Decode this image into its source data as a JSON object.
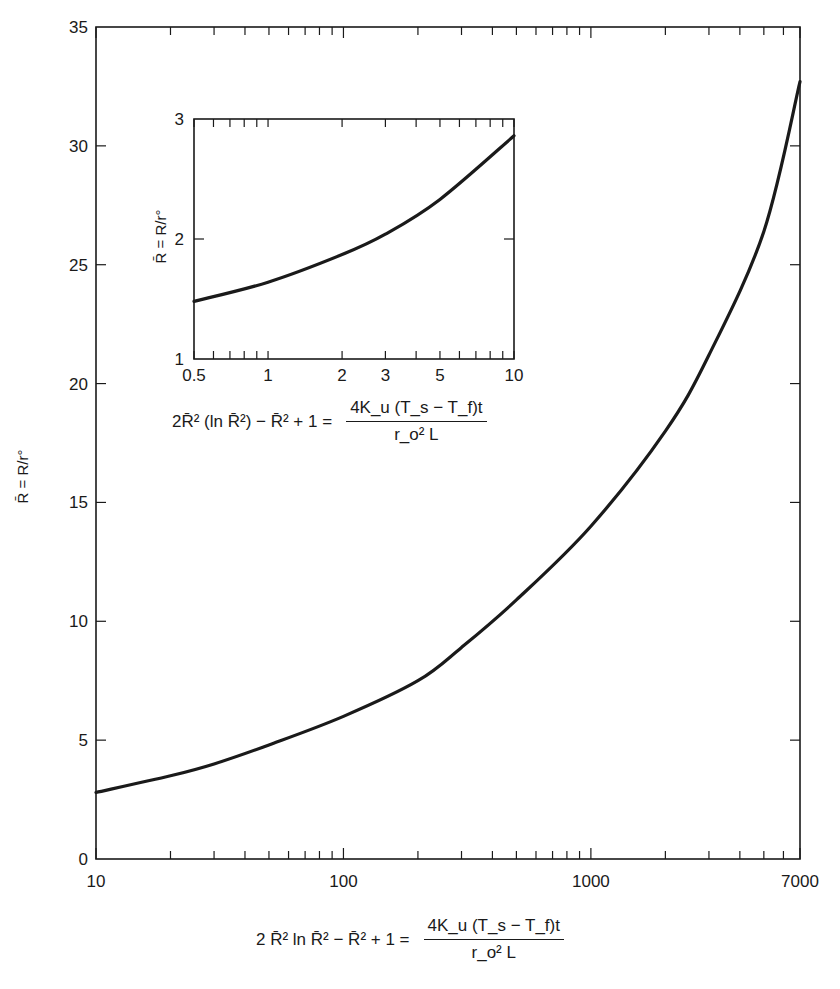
{
  "chart_data": [
    {
      "id": "main",
      "type": "line",
      "title": "",
      "xscale": "log",
      "xlabel": "2 R̄² ln R̄² − R̄² + 1 = 4K_u(T_s − T_f)t / (r_o² L)",
      "ylabel": "R̄ = R/r°",
      "xlim": [
        10,
        7000
      ],
      "ylim": [
        0,
        35
      ],
      "x_tick_labels": [
        "10",
        "100",
        "1000",
        "7000"
      ],
      "x_tick_values": [
        10,
        100,
        1000,
        7000
      ],
      "y_tick_labels": [
        "0",
        "5",
        "10",
        "15",
        "20",
        "25",
        "30",
        "35"
      ],
      "y_tick_values": [
        0,
        5,
        10,
        15,
        20,
        25,
        30,
        35
      ],
      "grid": false,
      "series": [
        {
          "name": "R̄",
          "x": [
            10,
            20,
            30,
            50,
            100,
            200,
            300,
            500,
            1000,
            2000,
            3000,
            5000,
            7000
          ],
          "y": [
            2.8,
            3.5,
            4.0,
            4.8,
            6.0,
            7.5,
            8.9,
            10.9,
            14.0,
            18.0,
            21.2,
            26.4,
            32.7
          ]
        }
      ]
    },
    {
      "id": "inset",
      "type": "line",
      "title": "",
      "xscale": "log",
      "xlabel": "2R̄² (ln R̄²) − R̄² + 1 = 4K_u(T_s − T_f)t / (r_o² L)",
      "ylabel": "R̄ = R/r°",
      "xlim": [
        0.5,
        10
      ],
      "ylim": [
        1,
        3
      ],
      "x_tick_labels": [
        "0.5",
        "1",
        "2",
        "3",
        "5",
        "10"
      ],
      "x_tick_values": [
        0.5,
        1,
        2,
        3,
        5,
        10
      ],
      "y_tick_labels": [
        "1",
        "2",
        "3"
      ],
      "y_tick_values": [
        1,
        2,
        3
      ],
      "grid": false,
      "series": [
        {
          "name": "R̄",
          "x": [
            0.5,
            1,
            2,
            3,
            5,
            10
          ],
          "y": [
            1.48,
            1.64,
            1.87,
            2.04,
            2.33,
            2.86
          ]
        }
      ]
    }
  ],
  "main_formula": {
    "lhs": "2 R̄² ln R̄² − R̄² + 1 =",
    "numerator": "4K_u (T_s − T_f)t",
    "denominator": "r_o² L"
  },
  "inset_formula": {
    "lhs": "2R̄² (ln R̄²) − R̄² + 1 =",
    "numerator": "4K_u (T_s − T_f)t",
    "denominator": "r_o² L"
  },
  "y_title": "R̄ = R/r°",
  "colors": {
    "ink": "#1a1a1a",
    "background": "#ffffff"
  }
}
